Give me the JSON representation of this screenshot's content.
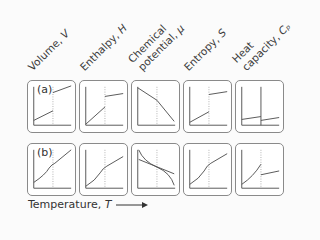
{
  "columns": [
    {
      "name": "Volume, ",
      "symbol": "V"
    },
    {
      "name": "Enthalpy, ",
      "symbol": "H"
    },
    {
      "name_line1": "Chemical",
      "name": "potential, ",
      "symbol": "μ"
    },
    {
      "name": "Entropy, ",
      "symbol": "S"
    },
    {
      "name_line1": "Heat",
      "name": "capacity, ",
      "symbol": "Cₚ"
    }
  ],
  "rows": [
    {
      "tag": "(a)",
      "description": "first-order transition"
    },
    {
      "tag": "(b)",
      "description": "second-order transition"
    }
  ],
  "x_axis": {
    "label": "Temperature, ",
    "symbol": "T"
  },
  "colors": {
    "line": "#555555",
    "axis": "#555555",
    "divider": "#999999",
    "border": "#8a8a8a"
  }
}
